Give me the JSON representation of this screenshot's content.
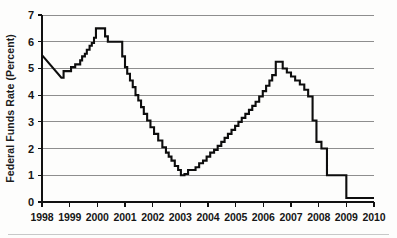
{
  "chart_data": {
    "type": "line",
    "title": "",
    "xlabel": "",
    "ylabel": "Federal Funds Rate (Percent)",
    "xlim": [
      1998,
      2010
    ],
    "ylim": [
      0,
      7
    ],
    "grid": true,
    "legend": null,
    "yticks": [
      0,
      1,
      2,
      3,
      4,
      5,
      6,
      7
    ],
    "ytick_labels": [
      "0",
      "1",
      "2",
      "3",
      "4",
      "5",
      "6",
      "7"
    ],
    "xticks": [
      1998,
      1999,
      2000,
      2001,
      2002,
      2003,
      2004,
      2005,
      2006,
      2007,
      2008,
      2009,
      2010
    ],
    "xtick_labels": [
      "1998",
      "1999",
      "2000",
      "2001",
      "2002",
      "2003",
      "2004",
      "2005",
      "2006",
      "2007",
      "2008",
      "2009",
      "2010"
    ],
    "series": [
      {
        "name": "Federal Funds Rate",
        "color": "#0d0d0d",
        "step": "post",
        "x": [
          1998.0,
          1998.7,
          1998.78,
          1998.95,
          1999.05,
          1999.2,
          1999.38,
          1999.45,
          1999.55,
          1999.62,
          1999.72,
          1999.8,
          1999.88,
          1999.95,
          2000.12,
          2000.28,
          2000.38,
          2000.5,
          2000.62,
          2000.78,
          2000.9,
          2001.0,
          2001.08,
          2001.18,
          2001.28,
          2001.38,
          2001.48,
          2001.58,
          2001.68,
          2001.8,
          2001.92,
          2002.05,
          2002.2,
          2002.35,
          2002.48,
          2002.58,
          2002.68,
          2002.8,
          2002.92,
          2003.02,
          2003.15,
          2003.28,
          2003.42,
          2003.55,
          2003.68,
          2003.82,
          2003.95,
          2004.08,
          2004.22,
          2004.35,
          2004.48,
          2004.6,
          2004.72,
          2004.85,
          2004.98,
          2005.1,
          2005.22,
          2005.35,
          2005.48,
          2005.6,
          2005.72,
          2005.85,
          2005.98,
          2006.1,
          2006.22,
          2006.32,
          2006.45,
          2006.58,
          2006.7,
          2006.85,
          2007.0,
          2007.15,
          2007.32,
          2007.48,
          2007.62,
          2007.78,
          2007.92,
          2008.1,
          2008.3,
          2009.0,
          2010.0
        ],
        "y": [
          5.5,
          4.65,
          4.9,
          4.9,
          5.05,
          5.15,
          5.3,
          5.45,
          5.55,
          5.7,
          5.85,
          5.95,
          6.15,
          6.5,
          6.5,
          6.2,
          6.0,
          6.0,
          6.0,
          6.0,
          5.45,
          5.05,
          4.8,
          4.55,
          4.3,
          4.0,
          3.8,
          3.55,
          3.3,
          3.05,
          2.8,
          2.55,
          2.3,
          2.05,
          1.85,
          1.7,
          1.55,
          1.35,
          1.2,
          1.0,
          1.05,
          1.2,
          1.2,
          1.3,
          1.45,
          1.55,
          1.7,
          1.85,
          1.95,
          2.1,
          2.25,
          2.4,
          2.55,
          2.7,
          2.85,
          3.0,
          3.15,
          3.3,
          3.45,
          3.6,
          3.75,
          3.95,
          4.15,
          4.35,
          4.55,
          4.75,
          5.25,
          5.25,
          5.0,
          4.85,
          4.7,
          4.55,
          4.4,
          4.2,
          3.95,
          3.05,
          2.25,
          2.0,
          1.0,
          0.15,
          0.15
        ]
      }
    ],
    "annotations": []
  },
  "layout": {
    "plot_left": 42,
    "plot_right": 374,
    "plot_top": 15,
    "plot_bottom": 202
  }
}
